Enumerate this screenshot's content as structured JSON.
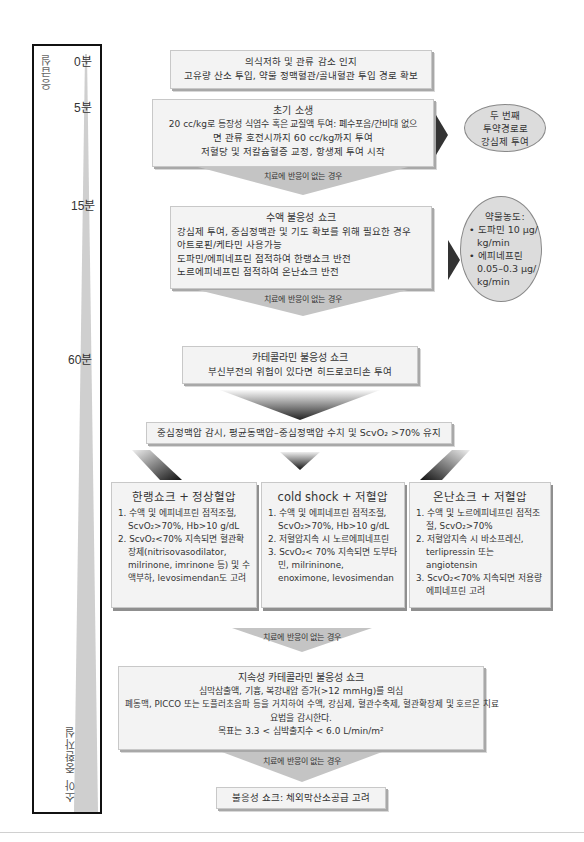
{
  "timeline": {
    "top_label": "응급실",
    "bottom_label": "소아 중환자실",
    "marks": [
      {
        "label": "0분",
        "y": 46
      },
      {
        "label": "5분",
        "y": 101
      },
      {
        "label": "15분",
        "y": 195
      },
      {
        "label": "60분",
        "y": 349
      }
    ]
  },
  "steps": {
    "recognition": {
      "lines": [
        "의식저하 및 관류 감소 인지",
        "고유량 산소 투입, 약물 정맥혈관/골내혈관 투입 경로 확보"
      ]
    },
    "initial_resuscitation": {
      "title": "초기 소생",
      "lines": [
        "20 cc/kg로 등장성 식염수 혹은 교질액 투여: 폐수포음/간비대 없으",
        "면 관류 호전시까지 60 cc/kg까지 투여",
        "저혈당 및 저칼슘혈증 교정, 항생제 투여 시작"
      ]
    },
    "fluid_refractory": {
      "title": "수액 불응성 쇼크",
      "lines": [
        "강심제 투여, 중심정맥관 및 기도 확보를 위해 필요한 경우",
        "아트로핀/케타민 사용가능",
        "도파민/에피네프린 점적하여 한랭쇼크 반전",
        "노르에피네프린 점적하여 온난쇼크 반전"
      ]
    },
    "catecholamine_resistant": {
      "title": "카테콜라민 불응성 쇼크",
      "lines": [
        "부신부전의 위험이 있다면 히드로코티손 투여"
      ]
    },
    "monitoring": {
      "line": "중심정맥압 감시, 평균동맥압–중심정맥압 수치 및 ScvO₂ >70% 유지"
    },
    "persistent": {
      "title": "지속성 카테콜라민 불응성 쇼크",
      "lines": [
        "심막삼출액, 기흉, 복강내압 증가(>12 mmHg)를 의심",
        "폐동맥, PICCO 또는 도플러초음파 등을 거치하여 수액, 강심제, 혈관수축제, 혈관확장제 및 호르몬 치료",
        "요법을 감시한다.",
        "목표는 3.3 < 심박출지수 < 6.0 L/min/m²"
      ]
    },
    "refractory": {
      "line": "불응성 쇼크: 체외막산소공급 고려"
    }
  },
  "arrows": {
    "no_response": "치료에 반응이 없는 경우"
  },
  "side_notes": {
    "second_route": {
      "lines": [
        "두 번째",
        "투약경로로",
        "강심제 투여"
      ]
    },
    "drug_dose": {
      "title": "약물농도:",
      "bullets": [
        {
          "lines": [
            "도파민 10 μg/",
            "kg/min"
          ]
        },
        {
          "lines": [
            "에피네프린",
            "0.05–0.3 μg/",
            "kg/min"
          ]
        }
      ]
    }
  },
  "columns": [
    {
      "title": "한랭쇼크 + 정상혈압",
      "items": [
        "1. 수액 및 에피네프린 점적조절, ScvO₂>70%, Hb>10 g/dL",
        "2. ScvO₂<70% 지속되면 혈관확장제(nitrisovasodilator, milrinone, imrinone 등) 및 수액부하, levosimendan도 고려"
      ]
    },
    {
      "title": "cold shock + 저혈압",
      "items": [
        "1. 수액 및 에피네프린 점적조절, ScvO₂>70%, Hb>10 g/dL",
        "2. 저혈압지속 시 노르에피네프린",
        "3. ScvO₂< 70% 지속되면 도부타민, milrininone, enoximone, levosimendan"
      ]
    },
    {
      "title": "온난쇼크 + 저혈압",
      "items": [
        "1. 수액 및 노르에피네프린 점적조절, ScvO₂>70%",
        "2. 저혈압지속 시 바소프레신, terlipressin 또는 angiotensin",
        "3. ScvO₂<70% 지속되면 저용량 에피네프린 고려"
      ]
    }
  ],
  "colors": {
    "box_fill": "#f3f3f3",
    "box_border": "#c8c8c8",
    "arrow_fill": "#c4c4c4",
    "ellipse_fill": "#dcdcdc",
    "timeline_wedge": "#cfcfcf"
  }
}
